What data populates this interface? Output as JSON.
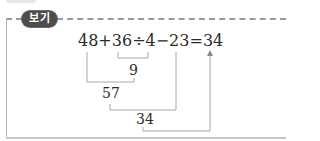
{
  "badge": {
    "label": "보기"
  },
  "equation": {
    "text": "48+36÷4−23=34"
  },
  "steps": [
    {
      "operation": "36÷4",
      "result": "9"
    },
    {
      "operation": "48+9",
      "result": "57"
    },
    {
      "operation": "57−23",
      "result": "34"
    }
  ],
  "final_answer": "34",
  "colors": {
    "badge_bg": "#4d4d4d",
    "badge_text": "#ffffff",
    "line": "#a8a8a8",
    "text": "#2b2b2b"
  }
}
